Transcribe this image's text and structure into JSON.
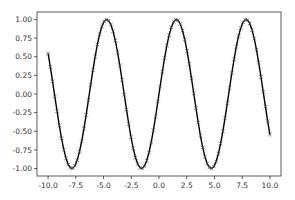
{
  "chart_data": {
    "type": "line",
    "title": "",
    "xlabel": "",
    "ylabel": "",
    "xlim": [
      -11.0,
      11.0
    ],
    "ylim": [
      -1.1,
      1.1
    ],
    "grid": false,
    "legend": null,
    "x_ticks": [
      -10.0,
      -7.5,
      -5.0,
      -2.5,
      0.0,
      2.5,
      5.0,
      7.5,
      10.0
    ],
    "x_tick_labels": [
      "-10.0",
      "-7.5",
      "-5.0",
      "-2.5",
      "0.0",
      "2.5",
      "5.0",
      "7.5",
      "10.0"
    ],
    "y_ticks": [
      -1.0,
      -0.75,
      -0.5,
      -0.25,
      0.0,
      0.25,
      0.5,
      0.75,
      1.0
    ],
    "y_tick_labels": [
      "-1.00",
      "-0.75",
      "-0.50",
      "-0.25",
      "0.00",
      "0.25",
      "0.50",
      "0.75",
      "1.00"
    ],
    "series": [
      {
        "name": "sin(x)",
        "function": "sin",
        "x_start": -10.0,
        "x_end": 10.0,
        "num_points": 100,
        "color": "#000000",
        "line_style": "solid",
        "marker": "x",
        "marker_color": "#444444"
      }
    ]
  },
  "colors": {
    "axes": "#333333",
    "line": "#000000",
    "marker": "#555555",
    "background": "#ffffff"
  }
}
